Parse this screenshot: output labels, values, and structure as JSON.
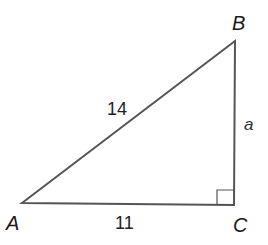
{
  "diagram": {
    "type": "right-triangle",
    "colors": {
      "stroke": "#555555",
      "text": "#1a1a1a",
      "background": "#ffffff"
    },
    "vertices": {
      "A": {
        "label": "A",
        "x": 22,
        "y": 203
      },
      "B": {
        "label": "B",
        "x": 235,
        "y": 41
      },
      "C": {
        "label": "C",
        "x": 234,
        "y": 205
      }
    },
    "sides": {
      "AB": {
        "label": "14"
      },
      "AC": {
        "label": "11"
      },
      "BC": {
        "label": "a"
      }
    },
    "right_angle_at": "C"
  }
}
